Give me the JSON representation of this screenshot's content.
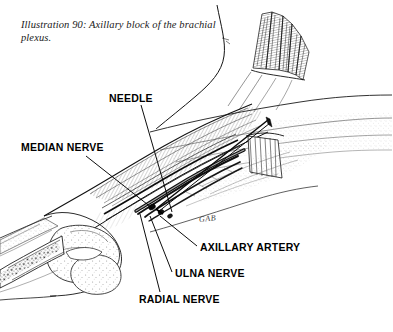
{
  "page": {
    "background_color": "#ffffff",
    "ink_color": "#000000",
    "width": 393,
    "height": 332
  },
  "caption": {
    "line1": "Illustration 90: Axillary block of the",
    "line2": "brachial plexus."
  },
  "signature": {
    "text": "GAB"
  },
  "annotations": [
    {
      "key": "needle",
      "label": "NEEDLE",
      "leader_from": [
        141,
        105
      ],
      "leader_to": [
        172,
        212
      ]
    },
    {
      "key": "median",
      "label": "MEDIAN NERVE",
      "leader_from": [
        86,
        156
      ],
      "leader_to": [
        152,
        208
      ]
    },
    {
      "key": "axillary",
      "label": "AXILLARY ARTERY",
      "leader_from": [
        197,
        246
      ],
      "leader_to": [
        160,
        216
      ]
    },
    {
      "key": "ulna",
      "label": "ULNA NERVE",
      "leader_from": [
        172,
        272
      ],
      "leader_to": [
        150,
        216
      ]
    },
    {
      "key": "radial",
      "label": "RADIAL NERVE",
      "leader_from": [
        160,
        292
      ],
      "leader_to": [
        140,
        214
      ]
    }
  ]
}
